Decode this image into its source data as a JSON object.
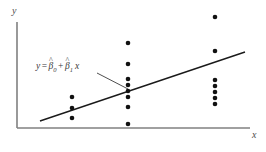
{
  "figure": {
    "title": "",
    "y_axis_label": "y",
    "x_axis_label": "x",
    "equation": {
      "lhs": "y",
      "equals": "=",
      "beta0": "β",
      "beta0_sub": "0",
      "beta0_hat": "^",
      "plus": "+",
      "beta1": "β",
      "beta1_sub": "1",
      "beta1_hat": "^",
      "xvar": "x",
      "full_text": "y = β̂0 + β̂1 x"
    },
    "colors": {
      "axis": "#808080",
      "line": "#1a1a1a",
      "point": "#111111",
      "leader": "#3a3a3a",
      "background": "#ffffff",
      "label_text": "#4d4d4d",
      "equation_text": "#3a3a3a"
    }
  },
  "chart_data": {
    "type": "scatter",
    "title": "",
    "xlabel": "x",
    "ylabel": "y",
    "xlim": [
      0,
      266
    ],
    "ylim": [
      0,
      152
    ],
    "grid": false,
    "legend": null,
    "axes": {
      "y_axis": {
        "x": 17,
        "y_top": 22,
        "y_bottom": 128
      },
      "x_axis": {
        "y": 128,
        "x_left": 17,
        "x_right": 250
      }
    },
    "series": [
      {
        "name": "observations",
        "marker": "filled-circle",
        "marker_radius": 2.3,
        "color": "#111111",
        "points": [
          {
            "x": 72,
            "y": 97
          },
          {
            "x": 72,
            "y": 108
          },
          {
            "x": 72,
            "y": 118
          },
          {
            "x": 128,
            "y": 43
          },
          {
            "x": 128,
            "y": 64
          },
          {
            "x": 128,
            "y": 79
          },
          {
            "x": 128,
            "y": 85
          },
          {
            "x": 128,
            "y": 91
          },
          {
            "x": 128,
            "y": 97
          },
          {
            "x": 128,
            "y": 107
          },
          {
            "x": 128,
            "y": 124
          },
          {
            "x": 215,
            "y": 17
          },
          {
            "x": 215,
            "y": 51
          },
          {
            "x": 215,
            "y": 80
          },
          {
            "x": 215,
            "y": 86
          },
          {
            "x": 215,
            "y": 92
          },
          {
            "x": 215,
            "y": 98
          },
          {
            "x": 215,
            "y": 104
          }
        ]
      }
    ],
    "fit_line": {
      "name": "least-squares regression line",
      "label": "y = β̂0 + β̂1 x",
      "x1": 40,
      "y1": 121,
      "x2": 245,
      "y2": 52,
      "color": "#1a1a1a",
      "width": 1.4
    },
    "annotation": {
      "text": "y = β̂0 + β̂1 x",
      "text_x": 36,
      "text_y": 70,
      "leader": {
        "x1": 97,
        "y1": 73,
        "x2": 128,
        "y2": 89
      }
    }
  }
}
